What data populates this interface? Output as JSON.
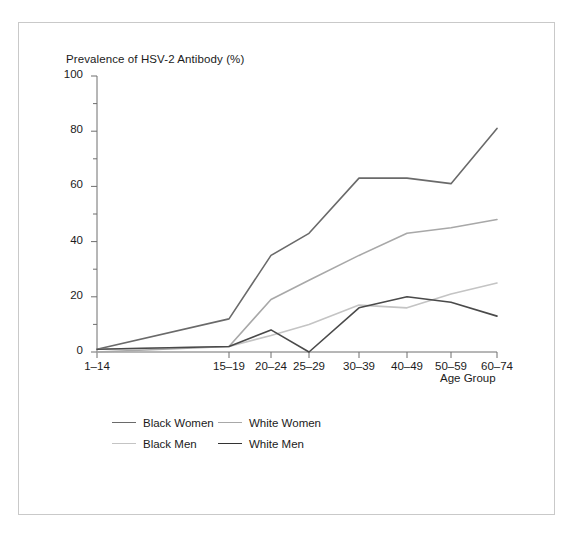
{
  "chart_data": {
    "type": "line",
    "title": "Prevalence of HSV-2 Antibody (%)",
    "xlabel": "Age Group",
    "ylabel": "",
    "categories": [
      "1–14",
      "15–19",
      "20–24",
      "25–29",
      "30–39",
      "40–49",
      "50–59",
      "60–74"
    ],
    "ylim": [
      0,
      100
    ],
    "yticks": [
      0,
      20,
      40,
      60,
      80,
      100
    ],
    "yticks_minor": [
      10,
      30,
      50,
      70,
      90
    ],
    "grid": false,
    "legend_position": "bottom-left",
    "series": [
      {
        "name": "Black Women",
        "color": "#6a6a6a",
        "values": [
          1,
          12,
          35,
          43,
          63,
          63,
          61,
          81
        ]
      },
      {
        "name": "White Women",
        "color": "#a8a8a8",
        "values": [
          0,
          2,
          19,
          26,
          35,
          43,
          45,
          48
        ]
      },
      {
        "name": "Black Men",
        "color": "#c4c4c4",
        "values": [
          1,
          2,
          6,
          10,
          17,
          16,
          21,
          25
        ]
      },
      {
        "name": "White Men",
        "color": "#4a4a4a",
        "values": [
          1,
          2,
          8,
          0,
          16,
          20,
          18,
          13
        ]
      }
    ]
  },
  "axis": {
    "ytick_labels": [
      "100",
      "80",
      "60",
      "40",
      "20",
      "0"
    ],
    "xtick_labels": [
      "1–14",
      "15–19",
      "20–24",
      "25–29",
      "30–39",
      "40–49",
      "50–59",
      "60–74"
    ]
  },
  "legend": {
    "rows": [
      [
        {
          "label": "Black Women",
          "color": "#6a6a6a"
        },
        {
          "label": "White Women",
          "color": "#a8a8a8"
        }
      ],
      [
        {
          "label": "Black Men",
          "color": "#c4c4c4"
        },
        {
          "label": "White Men",
          "color": "#333333"
        }
      ]
    ]
  },
  "style": {
    "axis_color": "#6f6f6f",
    "text_color": "#1b1b1b",
    "frame_color": "#c9c9c9",
    "background": "#ffffff"
  }
}
